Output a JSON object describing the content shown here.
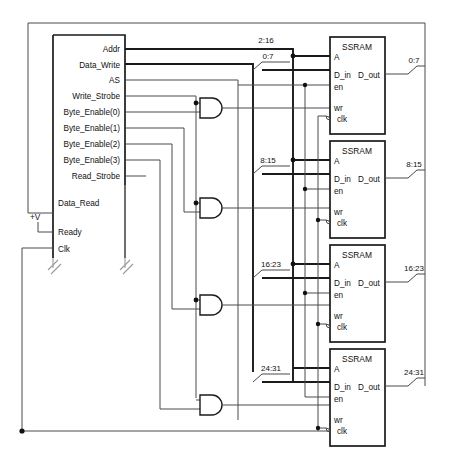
{
  "diagram": {
    "main_block": {
      "name": "interface-block",
      "pins": [
        "Addr",
        "Data_Write",
        "AS",
        "Write_Strobe",
        "Byte_Enable(0)",
        "Byte_Enable(1)",
        "Byte_Enable(2)",
        "Byte_Enable(3)",
        "Read_Strobe",
        "Data_Read",
        "Ready",
        "Clk"
      ]
    },
    "supply_label": "+V",
    "memories": [
      {
        "name": "SSRAM",
        "in_bus": "0:7",
        "addr_bus": "2:16",
        "out_bus": "0:7",
        "pins": [
          "A",
          "D_in",
          "D_out",
          "en",
          "wr",
          "clk"
        ]
      },
      {
        "name": "SSRAM",
        "in_bus": "8:15",
        "addr_bus": "",
        "out_bus": "8:15",
        "pins": [
          "A",
          "D_in",
          "D_out",
          "en",
          "wr",
          "clk"
        ]
      },
      {
        "name": "SSRAM",
        "in_bus": "16:23",
        "addr_bus": "",
        "out_bus": "16:23",
        "pins": [
          "A",
          "D_in",
          "D_out",
          "en",
          "wr",
          "clk"
        ]
      },
      {
        "name": "SSRAM",
        "in_bus": "24:31",
        "addr_bus": "",
        "out_bus": "24:31",
        "pins": [
          "A",
          "D_in",
          "D_out",
          "en",
          "wr",
          "clk"
        ]
      }
    ],
    "gates": [
      {
        "type": "and-gate",
        "index": 1
      },
      {
        "type": "and-gate",
        "index": 2
      },
      {
        "type": "and-gate",
        "index": 3
      },
      {
        "type": "and-gate",
        "index": 4
      }
    ],
    "colors": {
      "line": "#1a1a1a",
      "thin_line": "#4a4a4a",
      "ground": "#9a9a9a",
      "background": "#ffffff"
    }
  }
}
